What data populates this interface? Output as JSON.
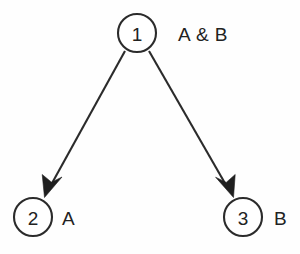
{
  "diagram": {
    "background_color": "#fefefe",
    "stroke_color": "#2b2b2b",
    "text_color": "#222222",
    "nodes": [
      {
        "id": "node-1",
        "number": "1",
        "label": "A & B",
        "cx": 137,
        "cy": 33,
        "r": 19,
        "label_x": 178,
        "label_y": 33
      },
      {
        "id": "node-2",
        "number": "2",
        "label": "A",
        "cx": 33,
        "cy": 217,
        "r": 19,
        "label_x": 62,
        "label_y": 217
      },
      {
        "id": "node-3",
        "number": "3",
        "label": "B",
        "cx": 243,
        "cy": 217,
        "r": 19,
        "label_x": 274,
        "label_y": 217
      }
    ],
    "edges": [
      {
        "id": "edge-1-2",
        "from": "node-1",
        "to": "node-2",
        "x1": 125,
        "y1": 51,
        "x2": 45,
        "y2": 196,
        "arrow": "down-left"
      },
      {
        "id": "edge-1-3",
        "from": "node-1",
        "to": "node-3",
        "x1": 149,
        "y1": 51,
        "x2": 232,
        "y2": 196,
        "arrow": "down-right"
      }
    ]
  }
}
